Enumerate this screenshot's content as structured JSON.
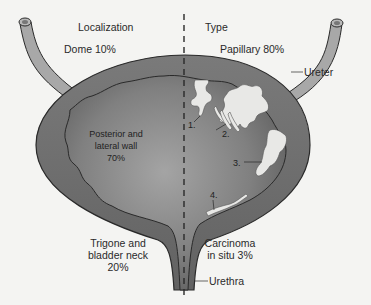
{
  "diagram": {
    "title_left": "Localization",
    "title_right": "Type",
    "localization": {
      "dome": "Dome 10%",
      "posterior_lateral": [
        "Posterior and",
        "lateral wall",
        "70%"
      ],
      "trigone": [
        "Trigone and",
        "bladder neck",
        "20%"
      ]
    },
    "type": {
      "papillary": "Papillary 80%",
      "cis": [
        "Carcinoma",
        "in situ 3%"
      ]
    },
    "anatomy_labels": {
      "ureter": "Ureter",
      "urethra": "Urethra"
    },
    "tumor_markers": [
      "1.",
      "2.",
      "3.",
      "4."
    ],
    "colors": {
      "background": "#f4f4f2",
      "bladder_wall": "#6a6a6a",
      "lumen_dark": "#5e5e5e",
      "lumen_light": "#9a9a9a",
      "tumor": "#e8e8e6",
      "ureter": "#a8a8a8",
      "outline": "#2a2a2a"
    }
  }
}
